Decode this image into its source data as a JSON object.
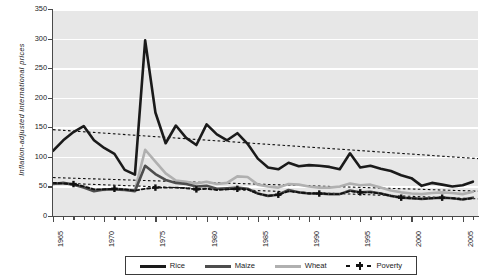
{
  "chart_data": {
    "type": "line",
    "title": "",
    "xlabel": "",
    "ylabel": "Inflation-adjusted international prices",
    "xlim": [
      1965,
      2006.5
    ],
    "ylim": [
      0,
      350
    ],
    "ytick_values": [
      0,
      50,
      100,
      150,
      200,
      250,
      300,
      350
    ],
    "ytick_labels": [
      "0",
      "50",
      "100",
      "150",
      "200",
      "250",
      "300",
      "350"
    ],
    "xtick_labels": [
      "1965",
      "1970",
      "1975",
      "1980",
      "1985",
      "1990",
      "1995",
      "2000",
      "2005"
    ],
    "xtick_values": [
      1965,
      1970,
      1975,
      1980,
      1985,
      1990,
      1995,
      2000,
      2005
    ],
    "grid": "horizontal-white",
    "legend_position": "bottom-outside",
    "x": [
      1965,
      1966,
      1967,
      1968,
      1969,
      1970,
      1971,
      1972,
      1973,
      1974,
      1975,
      1976,
      1977,
      1978,
      1979,
      1980,
      1981,
      1982,
      1983,
      1984,
      1985,
      1986,
      1987,
      1988,
      1989,
      1990,
      1991,
      1992,
      1993,
      1994,
      1995,
      1996,
      1997,
      1998,
      1999,
      2000,
      2001,
      2002,
      2003,
      2004,
      2005,
      2006
    ],
    "series": [
      {
        "name": "Rice",
        "color": "#1a1a1a",
        "width": 2.6,
        "values": [
          110,
          128,
          142,
          152,
          128,
          115,
          105,
          78,
          70,
          297,
          175,
          123,
          153,
          132,
          120,
          155,
          138,
          128,
          140,
          122,
          97,
          82,
          79,
          90,
          84,
          86,
          85,
          83,
          79,
          106,
          82,
          85,
          80,
          76,
          69,
          64,
          51,
          56,
          53,
          50,
          52,
          58
        ]
      },
      {
        "name": "Maize",
        "color": "#4d4d4d",
        "width": 2.6,
        "values": [
          54,
          56,
          53,
          48,
          42,
          45,
          45,
          44,
          42,
          85,
          71,
          61,
          56,
          54,
          50,
          51,
          46,
          47,
          48,
          46,
          38,
          34,
          36,
          44,
          40,
          38,
          38,
          37,
          37,
          43,
          40,
          41,
          38,
          34,
          31,
          30,
          29,
          30,
          31,
          30,
          28,
          31
        ]
      },
      {
        "name": "Wheat",
        "color": "#b0b0b0",
        "width": 2.6,
        "values": [
          55,
          55,
          54,
          50,
          45,
          44,
          46,
          45,
          44,
          112,
          92,
          72,
          60,
          58,
          55,
          58,
          54,
          56,
          67,
          66,
          53,
          50,
          48,
          54,
          53,
          50,
          48,
          48,
          50,
          55,
          52,
          53,
          48,
          43,
          40,
          38,
          37,
          39,
          40,
          39,
          37,
          41
        ]
      },
      {
        "name": "Poverty",
        "color": "#111111",
        "width": 1.9,
        "style": "dashed-marker",
        "values": [
          56,
          55,
          54,
          50,
          45,
          45,
          46,
          45,
          43,
          46,
          48,
          48,
          48,
          47,
          45,
          46,
          44,
          45,
          46,
          45,
          38,
          34,
          36,
          42,
          40,
          38,
          38,
          37,
          37,
          42,
          40,
          40,
          38,
          34,
          31,
          30,
          29,
          30,
          31,
          30,
          28,
          30
        ]
      }
    ],
    "trendlines": [
      {
        "name": "Rice trend",
        "from": [
          1965,
          146
        ],
        "to": [
          2006.5,
          97
        ],
        "style": "dotted"
      },
      {
        "name": "Wheat/Maize trend upper",
        "from": [
          1965,
          65
        ],
        "to": [
          2006.5,
          42
        ],
        "style": "dotted"
      },
      {
        "name": "Poverty trend lower",
        "from": [
          1965,
          56
        ],
        "to": [
          2006.5,
          29
        ],
        "style": "dotted"
      }
    ]
  },
  "legend": {
    "items": [
      {
        "label": "Rice",
        "color": "#1a1a1a",
        "style": "solid"
      },
      {
        "label": "Maize",
        "color": "#4d4d4d",
        "style": "solid"
      },
      {
        "label": "Wheat",
        "color": "#b0b0b0",
        "style": "solid"
      },
      {
        "label": "Poverty",
        "color": "#111111",
        "style": "dashed-marker"
      }
    ]
  }
}
